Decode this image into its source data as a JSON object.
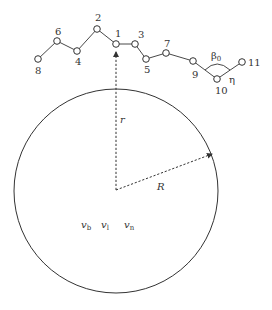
{
  "diagram": {
    "type": "polymer chain adsorbed near a sphere",
    "colors": {
      "stroke": "#333333",
      "background": "#ffffff"
    },
    "sphere": {
      "center": [
        116,
        190
      ],
      "radius": 102,
      "radius_label": "R",
      "distance_label": "r"
    },
    "chain": {
      "nodes": [
        {
          "id": "1",
          "label": "1",
          "x": 116,
          "y": 44
        },
        {
          "id": "2",
          "label": "2",
          "x": 97,
          "y": 29
        },
        {
          "id": "3",
          "label": "3",
          "x": 135,
          "y": 44
        },
        {
          "id": "4",
          "label": "4",
          "x": 77,
          "y": 51
        },
        {
          "id": "5",
          "label": "5",
          "x": 146,
          "y": 59
        },
        {
          "id": "6",
          "label": "6",
          "x": 57,
          "y": 41
        },
        {
          "id": "7",
          "label": "7",
          "x": 166,
          "y": 53
        },
        {
          "id": "8",
          "label": "8",
          "x": 38,
          "y": 59
        },
        {
          "id": "9",
          "label": "9",
          "x": 193,
          "y": 61
        },
        {
          "id": "10",
          "label": "10",
          "x": 217,
          "y": 79
        },
        {
          "id": "11",
          "label": "11",
          "x": 242,
          "y": 62
        }
      ],
      "bond_angle_label": "β",
      "bond_angle_subscript": "0",
      "torsion_label": "η"
    },
    "inner_labels": {
      "v_b": {
        "base": "v",
        "sub": "b"
      },
      "v_l": {
        "base": "v",
        "sub": "l"
      },
      "v_n": {
        "base": "v",
        "sub": "n"
      }
    }
  }
}
